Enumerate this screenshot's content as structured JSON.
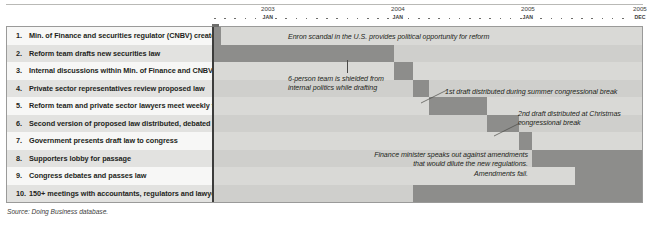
{
  "source_note": "Source: Doing Business database.",
  "axis": {
    "years": [
      {
        "label": "2003",
        "month": "JAN",
        "x": 48
      },
      {
        "label": "2004",
        "month": "JAN",
        "x": 178
      },
      {
        "label": "2005",
        "month": "JAN",
        "x": 308
      },
      {
        "label": "2005",
        "month": "DEC",
        "x": 420
      }
    ]
  },
  "rows": [
    {
      "num": "1.",
      "label": "Min. of Finance and securities regulator (CNBV) create reform team"
    },
    {
      "num": "2.",
      "label": "Reform team drafts new securities law"
    },
    {
      "num": "3.",
      "label": "Internal discussions within Min. of Finance and CNBV to finalize draft law"
    },
    {
      "num": "4.",
      "label": "Private sector representatives review proposed law"
    },
    {
      "num": "5.",
      "label": "Reform team and private sector lawyers meet weekly to revise law"
    },
    {
      "num": "6.",
      "label": "Second version of proposed law distributed, debated"
    },
    {
      "num": "7.",
      "label": "Government presents draft law to congress"
    },
    {
      "num": "8.",
      "label": "Supporters lobby for passage"
    },
    {
      "num": "9.",
      "label": "Congress debates and passes law"
    },
    {
      "num": "10.",
      "label": "150+ meetings with accountants, regulators and lawyers to discuss reforms"
    }
  ],
  "chart_data": {
    "type": "bar",
    "subtype": "gantt",
    "title": "",
    "xlabel": "",
    "ylabel": "",
    "x_axis_start": "2003-01",
    "x_axis_end": "2005-12",
    "grid": false,
    "legend": "none",
    "bar_color": "#8d8d8b",
    "categories": [
      "Min. of Finance and securities regulator (CNBV) create reform team",
      "Reform team drafts new securities law",
      "Internal discussions within Min. of Finance and CNBV to finalize draft law",
      "Private sector representatives review proposed law",
      "Reform team and private sector lawyers meet weekly to revise law",
      "Second version of proposed law distributed, debated",
      "Government presents draft law to congress",
      "Supporters lobby for passage",
      "Congress debates and passes law",
      "150+ meetings with accountants, regulators and lawyers to discuss reforms"
    ],
    "bars": [
      {
        "row": 1,
        "start_x": 0,
        "width": 7,
        "start": "2003-01",
        "end": "2003-02"
      },
      {
        "row": 2,
        "start_x": 0,
        "width": 180.5,
        "start": "2003-01",
        "end": "2004-04"
      },
      {
        "row": 3,
        "start_x": 180.5,
        "width": 18.5,
        "start": "2004-04",
        "end": "2004-06"
      },
      {
        "row": 4,
        "start_x": 199,
        "width": 16,
        "start": "2004-06",
        "end": "2004-07"
      },
      {
        "row": 5,
        "start_x": 215,
        "width": 58,
        "start": "2004-07",
        "end": "2004-12"
      },
      {
        "row": 6,
        "start_x": 273,
        "width": 32,
        "start": "2004-12",
        "end": "2005-03"
      },
      {
        "row": 7,
        "start_x": 305,
        "width": 13,
        "start": "2005-03",
        "end": "2005-04"
      },
      {
        "row": 8,
        "start_x": 318,
        "width": 110.4,
        "start": "2005-04",
        "end": "2005-12"
      },
      {
        "row": 9,
        "start_x": 361,
        "width": 67.4,
        "start": "2005-08",
        "end": "2005-12"
      },
      {
        "row": 10,
        "start_x": 199,
        "width": 229.4,
        "start": "2004-06",
        "end": "2005-12"
      }
    ]
  },
  "annotations": [
    {
      "id": "enron",
      "text": "Enron scandal in the U.S. provides political opportunity for reform",
      "align": "left"
    },
    {
      "id": "six-person-team",
      "text": "6-person team is shielded from\ninternal politics while drafting",
      "align": "left"
    },
    {
      "id": "first-draft",
      "text": "1st draft distributed during summer congressional break",
      "align": "left"
    },
    {
      "id": "second-draft",
      "text": "2nd draft distributed at Christmas\ncongressional break",
      "align": "left"
    },
    {
      "id": "finance-minister",
      "text": "Finance minister speaks out against amendments\nthat would dilute the new regulations.\nAmendments fail.",
      "align": "right"
    }
  ]
}
